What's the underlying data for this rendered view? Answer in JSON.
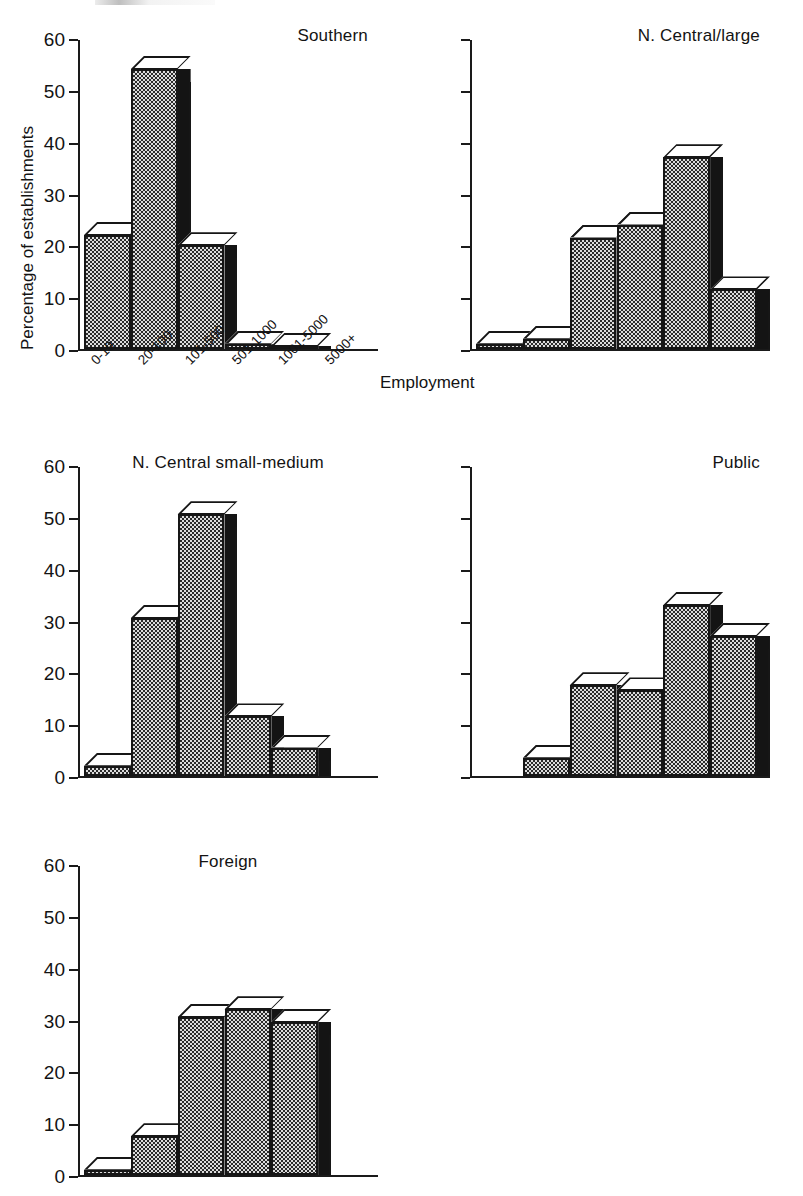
{
  "figure": {
    "ylabel": "Percentage of establishments",
    "xlabel": "Employment"
  },
  "chart_data": {
    "type": "bar",
    "title": "",
    "xlabel": "Employment",
    "ylabel": "Percentage of establishments",
    "ylim": [
      0,
      60
    ],
    "yticks": [
      0,
      10,
      20,
      30,
      40,
      50,
      60
    ],
    "grid": false,
    "legend": "none",
    "categories": [
      "0-19",
      "20-100",
      "101-500",
      "501-1000",
      "1001-5000",
      "5000+"
    ],
    "panels": [
      {
        "name": "Southern",
        "title_align": "right",
        "show_yticklabels": true,
        "show_xticklabels": true,
        "values": [
          22,
          54,
          20,
          1,
          0.4,
          0
        ]
      },
      {
        "name": "N. Central/large",
        "title_align": "right",
        "show_yticklabels": false,
        "show_xticklabels": false,
        "values": [
          1,
          2,
          21.5,
          24,
          37,
          11.5
        ]
      },
      {
        "name": "N. Central small-medium",
        "title_align": "center",
        "show_yticklabels": true,
        "show_xticklabels": false,
        "values": [
          2,
          30.5,
          50.5,
          11.5,
          5.5,
          0
        ]
      },
      {
        "name": "Public",
        "title_align": "right",
        "show_yticklabels": false,
        "show_xticklabels": false,
        "values": [
          0,
          3.5,
          17.5,
          16.5,
          33,
          27
        ]
      },
      {
        "name": "Foreign",
        "title_align": "center",
        "show_yticklabels": true,
        "show_xticklabels": false,
        "values": [
          1,
          7.5,
          30.5,
          32,
          29.5,
          0
        ]
      }
    ]
  },
  "colors": {
    "ink": "#161616",
    "bar_fill": "#dcdcdc",
    "bar_side": "#141414",
    "bar_top": "#ffffff"
  }
}
